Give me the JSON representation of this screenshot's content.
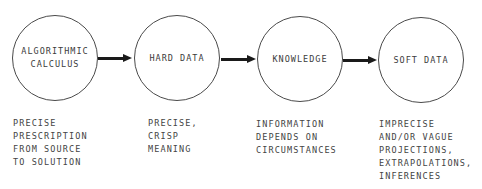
{
  "diagram": {
    "type": "flow",
    "direction": "left-to-right",
    "nodes": [
      {
        "id": "algorithmic-calculus",
        "label": "ALGORITHMIC\nCALCULUS",
        "description": [
          "PRECISE",
          "PRESCRIPTION",
          "FROM SOURCE",
          "TO SOLUTION"
        ]
      },
      {
        "id": "hard-data",
        "label": "HARD DATA",
        "description": [
          "PRECISE,",
          "CRISP",
          "MEANING"
        ]
      },
      {
        "id": "knowledge",
        "label": "KNOWLEDGE",
        "description": [
          "INFORMATION",
          "DEPENDS ON",
          "CIRCUMSTANCES"
        ]
      },
      {
        "id": "soft-data",
        "label": "SOFT DATA",
        "description": [
          "IMPRECISE",
          "AND/OR VAGUE",
          "PROJECTIONS,",
          "EXTRAPOLATIONS,",
          "INFERENCES"
        ]
      }
    ],
    "edges": [
      {
        "from": "algorithmic-calculus",
        "to": "hard-data"
      },
      {
        "from": "hard-data",
        "to": "knowledge"
      },
      {
        "from": "knowledge",
        "to": "soft-data"
      }
    ],
    "colors": {
      "stroke": "#4a4a4a",
      "arrow": "#1a1a1a",
      "text": "#3c3c3c",
      "background": "#ffffff"
    }
  }
}
